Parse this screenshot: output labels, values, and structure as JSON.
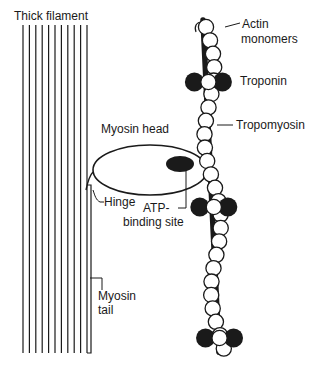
{
  "labels": {
    "thick_filament": "Thick filament",
    "actin_line1": "Actin",
    "actin_line2": "monomers",
    "troponin": "Troponin",
    "tropomyosin": "Tropomyosin",
    "myosin_head": "Myosin head",
    "hinge": "Hinge",
    "atp_line1": "ATP-",
    "atp_line2": "binding site",
    "myosin_tail_line1": "Myosin",
    "myosin_tail_line2": "tail"
  },
  "colors": {
    "ink": "#1a1a1a",
    "background": "#ffffff"
  },
  "thick_filament": {
    "line_count": 11
  },
  "actin": {
    "troponin_groups": 3
  }
}
